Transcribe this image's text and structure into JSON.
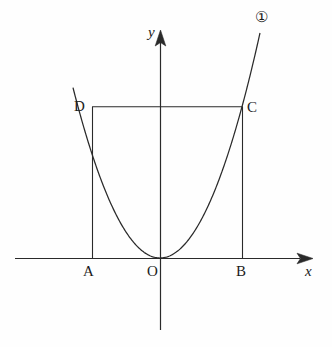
{
  "figure": {
    "kind": "coordinate-plane-geometry-figure",
    "background_color": "#fefefe",
    "stroke_color": "#2a2a2a",
    "text_color": "#1b1b1b",
    "axes": {
      "x_label": "x",
      "y_label": "y",
      "origin_label": "O",
      "x_axis": {
        "y": 258,
        "x_start": 15,
        "x_end": 313,
        "arrow": "right"
      },
      "y_axis": {
        "x": 160,
        "y_start": 30,
        "y_end": 330,
        "arrow": "up"
      }
    },
    "curve": {
      "marker_label": "①",
      "type": "parabola",
      "equation_form": "y = a x^2",
      "vertex": {
        "x": 0,
        "y": 0
      },
      "opens": "up",
      "a_pixels": 0.0225,
      "domain_px": [
        -87,
        100
      ]
    },
    "points": [
      {
        "name": "A",
        "label": "A",
        "px": {
          "x": 92,
          "y": 258
        },
        "on": "x-axis"
      },
      {
        "name": "B",
        "label": "B",
        "px": {
          "x": 242,
          "y": 258
        },
        "on": "x-axis"
      },
      {
        "name": "C",
        "label": "C",
        "px": {
          "x": 242,
          "y": 107
        },
        "on": "parabola"
      },
      {
        "name": "D",
        "label": "D",
        "px": {
          "x": 92,
          "y": 107
        },
        "on": "parabola"
      },
      {
        "name": "O",
        "label": "O",
        "px": {
          "x": 160,
          "y": 258
        },
        "on": "origin"
      }
    ],
    "segments": [
      {
        "name": "AD",
        "from": "A",
        "to": "D",
        "orientation": "vertical"
      },
      {
        "name": "BC",
        "from": "B",
        "to": "C",
        "orientation": "vertical"
      },
      {
        "name": "DC",
        "from": "D",
        "to": "C",
        "orientation": "horizontal"
      }
    ]
  },
  "chart_data": {
    "type": "line",
    "title": "",
    "xlabel": "x",
    "ylabel": "y",
    "grid": false,
    "legend": null,
    "annotations": [
      "①",
      "A",
      "B",
      "C",
      "D",
      "O"
    ],
    "series": [
      {
        "name": "①",
        "kind": "parabola",
        "x": [
          -87,
          -75,
          -60,
          -45,
          -30,
          -15,
          0,
          15,
          30,
          45,
          60,
          75,
          90,
          100
        ],
        "y": [
          170.3,
          126.6,
          81.0,
          45.6,
          20.3,
          5.1,
          0.0,
          5.1,
          20.3,
          45.6,
          81.0,
          126.6,
          182.3,
          225.0
        ]
      }
    ],
    "xlim": [
      -145,
      153
    ],
    "ylim": [
      -72,
      228
    ]
  }
}
